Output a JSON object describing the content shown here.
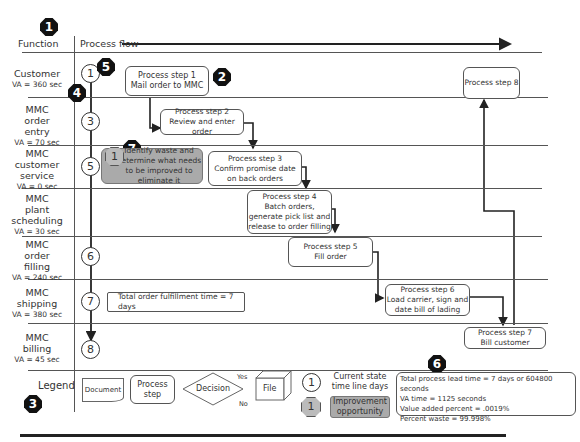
{
  "header": {
    "function_label": "Function",
    "process_flow_label": "Process flow"
  },
  "badges": {
    "b1": "1",
    "b2": "2",
    "b3": "3",
    "b4": "4",
    "b5": "5",
    "b6": "6",
    "b7": "7"
  },
  "lanes": [
    {
      "name": "Customer",
      "va": "VA = 360 sec",
      "timeline": "1"
    },
    {
      "name": "MMC order entry",
      "lines": [
        "MMC",
        "order",
        "entry"
      ],
      "va": "VA = 70 sec",
      "timeline": "3"
    },
    {
      "name": "MMC customer service",
      "lines": [
        "MMC",
        "customer",
        "service"
      ],
      "va": "VA = 0 sec",
      "timeline": "5"
    },
    {
      "name": "MMC plant scheduling",
      "lines": [
        "MMC",
        "plant",
        "scheduling"
      ],
      "va": "VA = 30 sec",
      "timeline": ""
    },
    {
      "name": "MMC order filling",
      "lines": [
        "MMC",
        "order",
        "filling"
      ],
      "va": "VA = 240 sec",
      "timeline": "6"
    },
    {
      "name": "MMC shipping",
      "lines": [
        "MMC",
        "shipping"
      ],
      "va": "VA = 380 sec",
      "timeline": "7"
    },
    {
      "name": "MMC billing",
      "lines": [
        "MMC",
        "billing"
      ],
      "va": "VA = 45 sec",
      "timeline": "8"
    }
  ],
  "steps": [
    {
      "title": "Process step 1",
      "desc": "Mail order to MMC"
    },
    {
      "title": "Process step 2",
      "desc": "Review and enter order"
    },
    {
      "title": "Process step 3",
      "desc": "Confirm promise date on back orders"
    },
    {
      "title": "Process step 4",
      "desc": "Batch orders, generate pick list and release to order filling"
    },
    {
      "title": "Process step 5",
      "desc": "Fill order"
    },
    {
      "title": "Process step 6",
      "desc": "Load carrier, sign and date bill of lading"
    },
    {
      "title": "Process step 7",
      "desc": "Bill customer"
    },
    {
      "title": "Process step 8",
      "desc": ""
    }
  ],
  "improvement": {
    "number": "1",
    "text": "Identify waste and determine what needs to be improved to eliminate it"
  },
  "fulfillment_note": "Total order fulfillment time = 7 days",
  "legend": {
    "label": "Legend",
    "document": "Document",
    "process_step": "Process step",
    "decision": "Decision",
    "yes": "Yes",
    "no": "No",
    "file": "File",
    "timeline_number": "1",
    "timeline_label": "Current state time line days",
    "improvement_number": "1",
    "improvement_label": "Improvement opportunity"
  },
  "summary": {
    "lead_time": "Total process lead time = 7 days or 604800 seconds",
    "va_time": "VA time = 1125 seconds",
    "va_percent": "Value added percent = .0019%",
    "waste_percent": "Percent waste = 99.998%"
  }
}
